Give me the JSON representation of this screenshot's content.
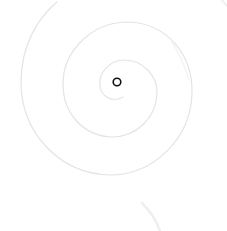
{
  "scene": {
    "background": "#ffffff",
    "spiral_color": "#e4e4e4",
    "faint_color": "#efefef",
    "center_marker_color": "#111111",
    "center": {
      "x": 117,
      "y": 82
    }
  }
}
